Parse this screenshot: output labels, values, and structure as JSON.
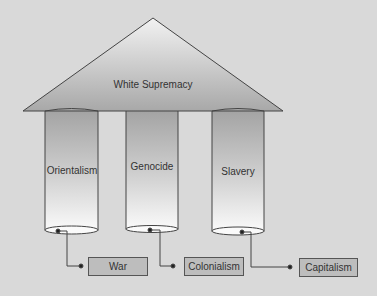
{
  "diagram": {
    "roof": {
      "label": "White Supremacy"
    },
    "pillars": [
      {
        "label": "Orientalism"
      },
      {
        "label": "Genocide"
      },
      {
        "label": "Slavery"
      }
    ],
    "outcomes": [
      {
        "label": "War"
      },
      {
        "label": "Colonialism"
      },
      {
        "label": "Capitalism"
      }
    ]
  },
  "colors": {
    "background": "#d9d9d9",
    "roof_top": "#f2f2f2",
    "roof_bottom": "#a8a8a8",
    "pillar_top": "#a3a3a3",
    "pillar_bottom": "#fafafa",
    "outcome_box": "#bdbdbd",
    "stroke": "#444444"
  }
}
